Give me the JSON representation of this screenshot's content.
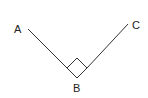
{
  "diagram": {
    "points": {
      "A": {
        "label": "A"
      },
      "B": {
        "label": "B"
      },
      "C": {
        "label": "C"
      }
    },
    "angle_at_B_degrees": 90,
    "right_angle_marker": true,
    "colors": {
      "line": "#333333",
      "text": "#222222",
      "background": "#ffffff"
    }
  }
}
